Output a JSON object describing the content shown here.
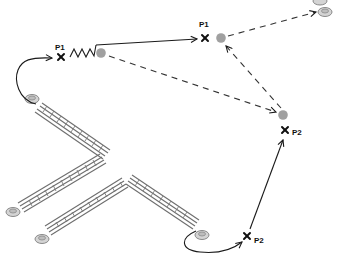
{
  "diagram": {
    "colors": {
      "background": "#ffffff",
      "line": "#1a1a1a",
      "dashed": "#333333",
      "gray_point": "#a0a0a0",
      "disc_fill": "#d4d4d4",
      "disc_stroke": "#8a8a8a",
      "ladder_rail": "#6e6e6e"
    },
    "points": [
      {
        "id": "p1-start",
        "label": "P1",
        "x": 61,
        "y": 57
      },
      {
        "id": "p1-end",
        "label": "P1",
        "x": 205,
        "y": 38
      },
      {
        "id": "p2-upper",
        "label": "P2",
        "x": 285,
        "y": 130
      },
      {
        "id": "p2-lower",
        "label": "P2",
        "x": 247,
        "y": 236
      }
    ],
    "gray_circles": [
      {
        "id": "gray-near-spring",
        "x": 101,
        "y": 53
      },
      {
        "id": "gray-near-p1",
        "x": 221,
        "y": 38
      },
      {
        "id": "gray-near-p2",
        "x": 283,
        "y": 115
      }
    ],
    "discs": [
      {
        "id": "disc-upper-ladder-top",
        "x": 32,
        "y": 100
      },
      {
        "id": "disc-upper-ladder-bottom",
        "x": 13,
        "y": 212
      },
      {
        "id": "disc-lower-ladder-left",
        "x": 42,
        "y": 239
      },
      {
        "id": "disc-lower-ladder-right",
        "x": 202,
        "y": 236
      },
      {
        "id": "disc-top-right-a",
        "x": 325,
        "y": 12
      },
      {
        "id": "disc-top-right-b",
        "x": 320,
        "y": 1
      }
    ],
    "connections": [
      {
        "from": "disc-upper-ladder-top",
        "to": "p1-start",
        "style": "solid-curve-arrow"
      },
      {
        "from": "p1-start",
        "to": "p1-end",
        "style": "spring-then-solid-arrow"
      },
      {
        "from": "gray-near-p1",
        "to": "disc-top-right-a",
        "style": "dashed-arrow"
      },
      {
        "from": "gray-near-spring",
        "to": "gray-near-p2",
        "style": "dashed-arrow"
      },
      {
        "from": "gray-near-p2",
        "to": "gray-near-p1",
        "style": "dashed-arrow"
      },
      {
        "from": "disc-lower-ladder-right",
        "to": "p2-lower",
        "style": "solid-curve-arrow"
      },
      {
        "from": "p2-lower",
        "to": "p2-upper",
        "style": "solid-arrow"
      }
    ],
    "labels": {
      "p1_start": "P1",
      "p1_end": "P1",
      "p2_upper": "P2",
      "p2_lower": "P2"
    }
  }
}
